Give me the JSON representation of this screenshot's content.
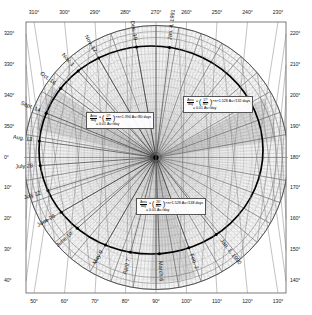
{
  "figure": {
    "center_label": "Sun",
    "accent_color": "#111111",
    "grid_color": "#8a8a8a",
    "orbit_color": "#000000"
  },
  "axes": {
    "unit": "degrees",
    "top": [
      "310°",
      "300°",
      "290°",
      "280°",
      "270°",
      "260°",
      "250°",
      "240°",
      "230°"
    ],
    "bottom": [
      "50°",
      "60°",
      "70°",
      "80°",
      "90°",
      "100°",
      "110°",
      "120°",
      "130°"
    ],
    "left": [
      "320°",
      "330°",
      "340°",
      "350°",
      "0°",
      "10°",
      "20°",
      "30°",
      "40°"
    ],
    "right": [
      "220°",
      "210°",
      "200°",
      "190°",
      "180°",
      "170°",
      "160°",
      "150°",
      "140°"
    ]
  },
  "date_marks": [
    {
      "label": "Jan. 1, 1990",
      "angle_deg": 232
    },
    {
      "label": "Feb. 2",
      "angle_deg": 250
    },
    {
      "label": "March 6",
      "angle_deg": 268
    },
    {
      "label": "April 7",
      "angle_deg": 285
    },
    {
      "label": "May 9",
      "angle_deg": 300
    },
    {
      "label": "June 10",
      "angle_deg": 318
    },
    {
      "label": "June 26",
      "angle_deg": 330
    },
    {
      "label": "July 12",
      "angle_deg": 343
    },
    {
      "label": "July 28",
      "angle_deg": 356
    },
    {
      "label": "Aug. 13",
      "angle_deg": 8
    },
    {
      "label": "Sept. 14",
      "angle_deg": 22
    },
    {
      "label": "Oct. 16",
      "angle_deg": 36
    },
    {
      "label": "Nov. 1",
      "angle_deg": 48
    },
    {
      "label": "Nov. 17",
      "angle_deg": 60
    },
    {
      "label": "Dec. 19",
      "angle_deg": 80
    },
    {
      "label": "Jan. 4, 1991",
      "angle_deg": 97
    }
  ],
  "equations": [
    {
      "id": "sweep-upper-left",
      "lhs_num": "Area",
      "lhs_den": "day",
      "frac_num": "17°",
      "frac_den": "360°",
      "rhs": "×π×1.394 Au²/80 days",
      "result": "= 0.01 Au²/day"
    },
    {
      "id": "sweep-upper-right",
      "lhs_num": "Area",
      "lhs_den": "day",
      "frac_num": "17°",
      "frac_den": "360°",
      "rhs": "×π×1.528 Au²/132 days",
      "result": "= 0.01 Au²/day"
    },
    {
      "id": "sweep-lower",
      "lhs_num": "Area",
      "lhs_den": "day",
      "frac_num": "26°",
      "frac_den": "360°",
      "rhs": "×π×1.528 Au²/148 days",
      "result": "= 0.01 Au²/day"
    }
  ],
  "chart_data": {
    "type": "scatter",
    "xlabel": "",
    "ylabel": "",
    "coordinate_system": "polar",
    "angle_unit": "degrees",
    "radial_unit": "Au",
    "grid": true,
    "legend_position": "none",
    "angle_ticks": [
      0,
      10,
      20,
      30,
      40,
      50,
      60,
      70,
      80,
      90,
      100,
      110,
      120,
      130,
      140,
      150,
      160,
      170,
      180,
      190,
      200,
      210,
      220,
      230,
      240,
      250,
      260,
      270,
      280,
      290,
      300,
      310,
      320,
      330,
      340,
      350
    ],
    "series": [
      {
        "name": "Orbit positions (date marks)",
        "theta_deg": [
          232,
          250,
          268,
          285,
          300,
          318,
          330,
          343,
          356,
          8,
          22,
          36,
          48,
          60,
          80,
          97
        ],
        "labels": [
          "Jan. 1, 1990",
          "Feb. 2",
          "March 6",
          "April 7",
          "May 9",
          "June 10",
          "June 26",
          "July 12",
          "July 28",
          "Aug. 13",
          "Sept. 14",
          "Oct. 16",
          "Nov. 1",
          "Nov. 17",
          "Dec. 19",
          "Jan. 4, 1991"
        ],
        "r_au": [
          1.52,
          1.5,
          1.46,
          1.4,
          1.33,
          1.26,
          1.22,
          1.19,
          1.16,
          1.14,
          1.13,
          1.15,
          1.19,
          1.25,
          1.38,
          1.48
        ]
      }
    ],
    "annotations": [
      "Area/day = (17°/360°)×π×1.394 Au²/80 days = 0.01 Au²/day",
      "Area/day = (17°/360°)×π×1.528 Au²/132 days = 0.01 Au²/day",
      "Area/day = (26°/360°)×π×1.528 Au²/148 days = 0.01 Au²/day"
    ]
  }
}
